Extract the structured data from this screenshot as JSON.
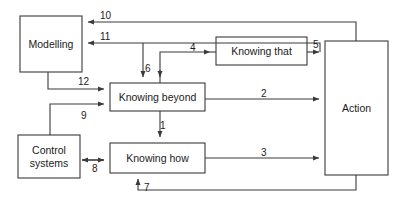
{
  "diagram": {
    "stroke_color": "#3a3a3a",
    "box_fill": "#ffffff",
    "text_color": "#1b1b1b",
    "nodes": [
      {
        "id": "modelling",
        "label": "Modelling",
        "x": 20,
        "y": 16,
        "w": 62,
        "h": 56
      },
      {
        "id": "knowing-beyond",
        "label": "Knowing beyond",
        "x": 110,
        "y": 83,
        "w": 95,
        "h": 28
      },
      {
        "id": "knowing-that",
        "label": "Knowing that",
        "x": 216,
        "y": 37,
        "w": 91,
        "h": 28
      },
      {
        "id": "knowing-how",
        "label": "Knowing how",
        "x": 110,
        "y": 143,
        "w": 95,
        "h": 30
      },
      {
        "id": "control-systems",
        "label": "Control\nsystems",
        "x": 18,
        "y": 135,
        "w": 62,
        "h": 43
      },
      {
        "id": "action",
        "label": "Action",
        "x": 325,
        "y": 41,
        "w": 63,
        "h": 134
      }
    ],
    "edges": [
      {
        "id": "e1",
        "label": "1",
        "from": "knowing-beyond",
        "to": "knowing-how",
        "label_x": 160,
        "label_y": 120
      },
      {
        "id": "e2",
        "label": "2",
        "from": "knowing-beyond",
        "to": "action",
        "label_x": 261,
        "label_y": 88
      },
      {
        "id": "e3",
        "label": "3",
        "from": "knowing-how",
        "to": "action",
        "label_x": 261,
        "label_y": 147
      },
      {
        "id": "e4",
        "label": "4",
        "from": "knowing-beyond",
        "to": "knowing-that",
        "label_x": 190,
        "label_y": 42
      },
      {
        "id": "e5",
        "label": "5",
        "from": "knowing-that",
        "to": "action",
        "label_x": 313,
        "label_y": 39
      },
      {
        "id": "e6",
        "label": "6",
        "from": "knowing-that",
        "to": "knowing-beyond",
        "label_x": 145,
        "label_y": 63
      },
      {
        "id": "e7",
        "label": "7",
        "from": "action",
        "to": "knowing-how",
        "label_x": 144,
        "label_y": 189
      },
      {
        "id": "e8",
        "label": "8",
        "from": "control-systems",
        "to": "knowing-how",
        "label_x": 92,
        "label_y": 168
      },
      {
        "id": "e9",
        "label": "9",
        "from": "control-systems",
        "to": "knowing-beyond",
        "label_x": 81,
        "label_y": 116
      },
      {
        "id": "e10",
        "label": "10",
        "from": "action",
        "to": "modelling",
        "label_x": 104,
        "label_y": 13
      },
      {
        "id": "e11",
        "label": "11",
        "from": "action",
        "to": "modelling",
        "label_x": 104,
        "label_y": 34
      },
      {
        "id": "e12",
        "label": "12",
        "from": "modelling",
        "to": "knowing-beyond",
        "label_x": 82,
        "label_y": 74
      }
    ]
  }
}
